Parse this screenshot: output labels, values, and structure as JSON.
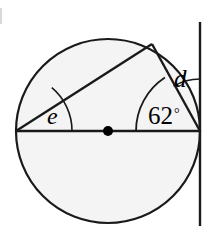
{
  "figure": {
    "type": "circle-geometry-diagram",
    "width": 213,
    "height": 226,
    "background_color": "#ffffff",
    "circle": {
      "center_x": 108,
      "center_y": 131,
      "radius": 92,
      "fill_color": "#f4f4f4",
      "stroke_color": "#1a1a1a",
      "stroke_width": 2.2
    },
    "center_dot": {
      "x": 108,
      "y": 131,
      "radius": 5,
      "color": "#000000"
    },
    "diameter": {
      "x1": 16,
      "y1": 131,
      "x2": 200,
      "y2": 131,
      "stroke_color": "#1a1a1a",
      "stroke_width": 2.6
    },
    "tangent_line": {
      "x": 200,
      "y_top": 22,
      "y_bottom": 226,
      "stroke_color": "#1a1a1a",
      "stroke_width": 2.4
    },
    "point_on_circle": {
      "x": 152,
      "y": 44
    },
    "chord_left": {
      "x1": 16,
      "y1": 131,
      "x2": 152,
      "y2": 44,
      "stroke_color": "#1a1a1a",
      "stroke_width": 2.4
    },
    "chord_right": {
      "x1": 200,
      "y1": 131,
      "x2": 152,
      "y2": 44,
      "stroke_color": "#1a1a1a",
      "stroke_width": 2.4
    },
    "radius_to_point": {
      "x1": 200,
      "y1": 131,
      "x2": 152,
      "y2": 44
    }
  },
  "labels": {
    "angle_e": "e",
    "angle_d": "d",
    "angle_numeric": "62",
    "degree_symbol": "°"
  },
  "arcs": {
    "arc_e": {
      "vertex_x": 16,
      "vertex_y": 131,
      "radius": 56,
      "stroke_color": "#1a1a1a",
      "stroke_width": 1.6
    },
    "arc_62": {
      "vertex_x": 200,
      "vertex_y": 131,
      "radius": 64,
      "stroke_color": "#1a1a1a",
      "stroke_width": 1.8
    },
    "arc_d": {
      "vertex_x": 200,
      "vertex_y": 131,
      "radius": 52,
      "stroke_color": "#1a1a1a",
      "stroke_width": 1.6
    }
  },
  "colors": {
    "stroke": "#1a1a1a",
    "fill": "#f4f4f4",
    "text": "#000000",
    "page_background": "#ffffff"
  }
}
